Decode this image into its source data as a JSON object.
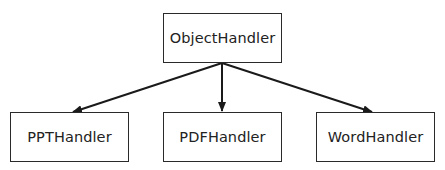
{
  "diagram": {
    "type": "hierarchy",
    "line_color": "#1a1a1a",
    "border_color": "#2a2a2a",
    "text_color": "#222222",
    "root": {
      "id": "object-handler",
      "label": "ObjectHandler",
      "box": {
        "x": 163,
        "y": 13,
        "w": 119,
        "h": 50
      }
    },
    "children": [
      {
        "id": "ppt-handler",
        "label": "PPTHandler",
        "box": {
          "x": 10,
          "y": 112,
          "w": 119,
          "h": 50
        }
      },
      {
        "id": "pdf-handler",
        "label": "PDFHandler",
        "box": {
          "x": 163,
          "y": 112,
          "w": 119,
          "h": 50
        }
      },
      {
        "id": "word-handler",
        "label": "WordHandler",
        "box": {
          "x": 316,
          "y": 112,
          "w": 119,
          "h": 50
        }
      }
    ],
    "edges": [
      {
        "from": "object-handler",
        "to": "ppt-handler"
      },
      {
        "from": "object-handler",
        "to": "pdf-handler"
      },
      {
        "from": "object-handler",
        "to": "word-handler"
      }
    ]
  }
}
